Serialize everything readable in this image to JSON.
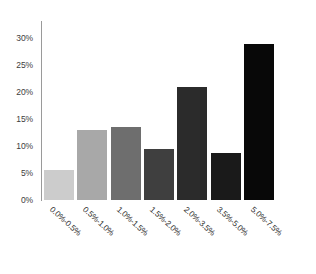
{
  "chart_data": {
    "type": "bar",
    "title": "",
    "subtitle": "",
    "xlabel": "",
    "ylabel": "",
    "categories": [
      "0.0%-0.5%",
      "0.5%-1.0%",
      "1.0%-1.5%",
      "1.5%-2.0%",
      "2.0%-3.5%",
      "3.5%-5.0%",
      "5.0%-7.5%"
    ],
    "values": [
      5.5,
      13.0,
      13.5,
      9.5,
      21.0,
      8.7,
      29.0
    ],
    "value_labels": [
      "",
      "",
      "",
      "",
      "",
      "",
      ""
    ],
    "bar_colors": [
      "#cccccc",
      "#a8a8a8",
      "#6e6e6e",
      "#3f3f3f",
      "#2b2b2b",
      "#1a1a1a",
      "#080808"
    ],
    "ylim": [
      0,
      33
    ],
    "yticks": [
      0,
      5,
      10,
      15,
      20,
      25,
      30
    ],
    "ytick_labels": [
      "0%",
      "5%",
      "10%",
      "15%",
      "20%",
      "25%",
      "30%"
    ],
    "grid": false,
    "legend": null,
    "axis_color": "#9a9a9a",
    "background": "#ffffff",
    "xtick_rotation_deg": 42
  }
}
